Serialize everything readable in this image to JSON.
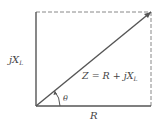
{
  "diagram": {
    "type": "impedance-phasor-triangle",
    "colors": {
      "line": "#555555",
      "dashed": "#888888",
      "text": "#444444",
      "background": "#ffffff"
    },
    "labels": {
      "vertical": {
        "j": "j",
        "X": "X",
        "sub": "L"
      },
      "hypotenuse": {
        "Z": "Z",
        "eq": " = ",
        "R": "R",
        "plus": " + ",
        "j": "j",
        "X": "X",
        "sub": "L"
      },
      "horizontal": "R",
      "angle": "θ"
    }
  }
}
